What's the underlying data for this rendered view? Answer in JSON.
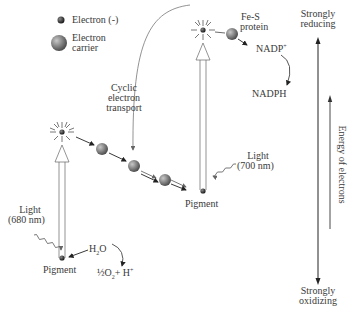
{
  "legend": {
    "electron": "Electron (-)",
    "carrier_line1": "Electron",
    "carrier_line2": "carrier"
  },
  "labels": {
    "cyclic_line1": "Cyclic",
    "cyclic_line2": "electron",
    "cyclic_line3": "transport",
    "fes_line1": "Fe-S",
    "fes_line2": "protein",
    "nadp": "NADP",
    "nadp_sup": "+",
    "nadph": "NADPH",
    "light700_line1": "Light",
    "light700_line2": "(700 nm)",
    "pigment_right": "Pigment",
    "light680_line1": "Light",
    "light680_line2": "(680 nm)",
    "pigment_left": "Pigment",
    "h2o": "H",
    "h2o_sub": "2",
    "h2o_tail": "O",
    "o2_half": "½O",
    "o2_sub": "2",
    "o2_tail": "+ H",
    "o2_sup": "+"
  },
  "axis": {
    "top": [
      "Strongly",
      "reducing"
    ],
    "bottom": [
      "Strongly",
      "oxidizing"
    ],
    "energy": "Energy of electrons"
  },
  "colors": {
    "line": "#333333",
    "carrier": "#7a7a7a",
    "carrier_highlight": "#bdbdbd",
    "electron": "#2a2a2a"
  }
}
